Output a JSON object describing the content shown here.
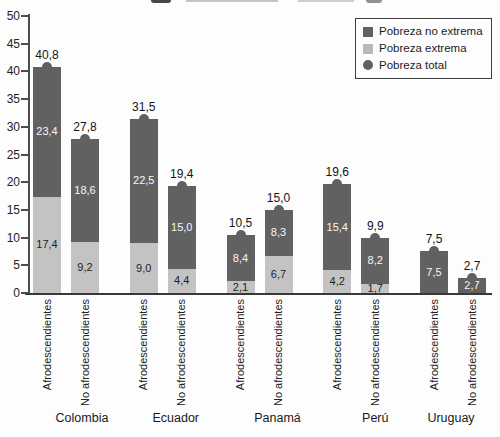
{
  "chart_data": {
    "type": "bar",
    "stacked": true,
    "grid": false,
    "ylim": [
      0,
      50
    ],
    "yticks": [
      "0",
      "5",
      "10",
      "15",
      "20",
      "25",
      "30",
      "35",
      "40",
      "45",
      "50"
    ],
    "legend_position": "top-right",
    "legend": [
      {
        "label": "Pobreza no extrema",
        "swatch": "square",
        "color": "#616161"
      },
      {
        "label": "Pobreza extrema",
        "swatch": "square",
        "color": "#c3c3c3"
      },
      {
        "label": "Pobreza total",
        "swatch": "circle",
        "color": "#616161"
      }
    ],
    "colors": {
      "no_extrema_segment": "#616161",
      "extrema_segment": "#c3c3c3",
      "total_marker": "#616161",
      "label_on_dark": "#f7f7f7",
      "label_on_light": "#1e1e1e",
      "axis": "#4d4d4d",
      "text": "#1c1c1c"
    },
    "groups": [
      {
        "country": "Colombia",
        "bars": [
          {
            "category": "Afrodescendientes",
            "pobreza_extrema": 17.4,
            "pobreza_no_extrema": 23.4,
            "pobreza_total": 40.8,
            "label_extrema": "17,4",
            "label_no_extrema": "23,4",
            "label_total": "40,8"
          },
          {
            "category": "No afrodescendientes",
            "pobreza_extrema": 9.2,
            "pobreza_no_extrema": 18.6,
            "pobreza_total": 27.8,
            "label_extrema": "9,2",
            "label_no_extrema": "18,6",
            "label_total": "27,8"
          }
        ]
      },
      {
        "country": "Ecuador",
        "bars": [
          {
            "category": "Afrodescendientes",
            "pobreza_extrema": 9.0,
            "pobreza_no_extrema": 22.5,
            "pobreza_total": 31.5,
            "label_extrema": "9,0",
            "label_no_extrema": "22,5",
            "label_total": "31,5"
          },
          {
            "category": "No afrodescendientes",
            "pobreza_extrema": 4.4,
            "pobreza_no_extrema": 15.0,
            "pobreza_total": 19.4,
            "label_extrema": "4,4",
            "label_no_extrema": "15,0",
            "label_total": "19,4"
          }
        ]
      },
      {
        "country": "Panamá",
        "bars": [
          {
            "category": "Afrodescendientes",
            "pobreza_extrema": 2.1,
            "pobreza_no_extrema": 8.4,
            "pobreza_total": 10.5,
            "label_extrema": "2,1",
            "label_no_extrema": "8,4",
            "label_total": "10,5"
          },
          {
            "category": "No afrodescendientes",
            "pobreza_extrema": 6.7,
            "pobreza_no_extrema": 8.3,
            "pobreza_total": 15.0,
            "label_extrema": "6,7",
            "label_no_extrema": "8,3",
            "label_total": "15,0"
          }
        ]
      },
      {
        "country": "Perú",
        "bars": [
          {
            "category": "Afrodescendientes",
            "pobreza_extrema": 4.2,
            "pobreza_no_extrema": 15.4,
            "pobreza_total": 19.6,
            "label_extrema": "4,2",
            "label_no_extrema": "15,4",
            "label_total": "19,6"
          },
          {
            "category": "No afrodescendientes",
            "pobreza_extrema": 1.7,
            "pobreza_no_extrema": 8.2,
            "pobreza_total": 9.9,
            "label_extrema": "1,7",
            "label_no_extrema": "8,2",
            "label_total": "9,9"
          }
        ]
      },
      {
        "country": "Uruguay",
        "bars": [
          {
            "category": "Afrodescendientes",
            "pobreza_extrema": null,
            "pobreza_no_extrema": 7.5,
            "pobreza_total": 7.5,
            "label_extrema": null,
            "label_no_extrema": "7,5",
            "label_total": "7,5"
          },
          {
            "category": "No afrodescendientes",
            "pobreza_extrema": null,
            "pobreza_no_extrema": 2.7,
            "pobreza_total": 2.7,
            "label_extrema": null,
            "label_no_extrema": "2,7",
            "label_total": "2,7"
          }
        ]
      }
    ]
  }
}
